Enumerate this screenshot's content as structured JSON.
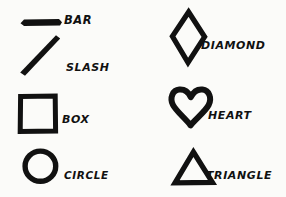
{
  "sheet": {
    "title": "Shape glyph reference sheet",
    "background_color": "#fbfbf9",
    "ink_color": "#111111",
    "columns": 2,
    "rows": 4
  },
  "shapes": [
    {
      "id": "bar",
      "icon": "bar-icon",
      "label": "BAR",
      "column": "left",
      "row": 1,
      "glyph_style": "filled",
      "box": {
        "x": 19,
        "y": 17,
        "w": 42,
        "h": 9
      },
      "stroke_width": 6
    },
    {
      "id": "slash",
      "icon": "slash-icon",
      "label": "SLASH",
      "column": "left",
      "row": 2,
      "glyph_style": "filled",
      "box": {
        "x": 18,
        "y": 34,
        "w": 42,
        "h": 42
      },
      "stroke_width": 6
    },
    {
      "id": "box",
      "icon": "box-icon",
      "label": "BOX",
      "column": "left",
      "row": 3,
      "glyph_style": "outline",
      "box": {
        "x": 18,
        "y": 94,
        "w": 38,
        "h": 38
      },
      "stroke_width": 5
    },
    {
      "id": "circle",
      "icon": "circle-icon",
      "label": "CIRCLE",
      "column": "left",
      "row": 4,
      "glyph_style": "outline",
      "box": {
        "x": 22,
        "y": 148,
        "w": 35,
        "h": 35
      },
      "stroke_width": 5
    },
    {
      "id": "diamond",
      "icon": "diamond-icon",
      "label": "DIAMOND",
      "column": "right",
      "row": 1,
      "glyph_style": "outline",
      "box": {
        "x": 169,
        "y": 9,
        "w": 38,
        "h": 55
      },
      "stroke_width": 5
    },
    {
      "id": "heart",
      "icon": "heart-icon",
      "label": "HEART",
      "column": "right",
      "row": 2,
      "glyph_style": "outline",
      "box": {
        "x": 168,
        "y": 86,
        "w": 44,
        "h": 41
      },
      "stroke_width": 6
    },
    {
      "id": "triangle",
      "icon": "triangle-icon",
      "label": "TRIANGLE",
      "column": "right",
      "row": 3,
      "glyph_style": "outline",
      "box": {
        "x": 172,
        "y": 149,
        "w": 42,
        "h": 35
      },
      "stroke_width": 5
    }
  ]
}
